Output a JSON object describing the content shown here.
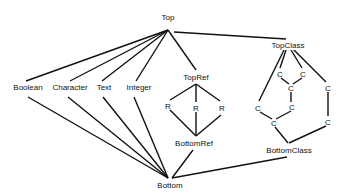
{
  "diagram": {
    "type": "lattice",
    "nodes": [
      {
        "id": "top",
        "label": "Top",
        "x": 168,
        "y": 18
      },
      {
        "id": "boolean",
        "label": "Boolean",
        "x": 28,
        "y": 88
      },
      {
        "id": "character",
        "label": "Character",
        "x": 70,
        "y": 88
      },
      {
        "id": "text",
        "label": "Text",
        "x": 104,
        "y": 88
      },
      {
        "id": "integer",
        "label": "Integer",
        "x": 139,
        "y": 88
      },
      {
        "id": "topref",
        "label": "TopRef",
        "x": 196,
        "y": 77
      },
      {
        "id": "r1",
        "label": "R",
        "x": 168,
        "y": 106
      },
      {
        "id": "r2",
        "label": "R",
        "x": 196,
        "y": 108
      },
      {
        "id": "r3",
        "label": "R",
        "x": 222,
        "y": 108
      },
      {
        "id": "bottomref",
        "label": "BottomRef",
        "x": 193,
        "y": 143
      },
      {
        "id": "topclass",
        "label": "TopClass",
        "x": 288,
        "y": 46
      },
      {
        "id": "c1",
        "label": "C",
        "x": 280,
        "y": 74
      },
      {
        "id": "c2",
        "label": "C",
        "x": 303,
        "y": 74
      },
      {
        "id": "c3",
        "label": "C",
        "x": 291,
        "y": 88
      },
      {
        "id": "c4",
        "label": "C",
        "x": 328,
        "y": 88
      },
      {
        "id": "c5",
        "label": "C",
        "x": 258,
        "y": 108
      },
      {
        "id": "c6",
        "label": "C",
        "x": 292,
        "y": 107
      },
      {
        "id": "c7",
        "label": "C",
        "x": 274,
        "y": 123
      },
      {
        "id": "c8",
        "label": "C",
        "x": 328,
        "y": 122
      },
      {
        "id": "bottomclass",
        "label": "BottomClass",
        "x": 288,
        "y": 150
      },
      {
        "id": "bottom",
        "label": "Bottom",
        "x": 170,
        "y": 186
      }
    ]
  }
}
